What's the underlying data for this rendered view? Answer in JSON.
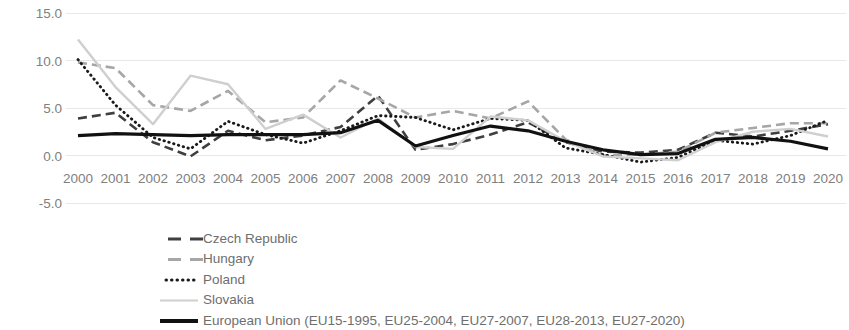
{
  "chart_data": {
    "type": "line",
    "title": "",
    "subtitle": "",
    "xlabel": "",
    "ylabel": "",
    "categories": [
      "2000",
      "2001",
      "2002",
      "2003",
      "2004",
      "2005",
      "2006",
      "2007",
      "2008",
      "2009",
      "2010",
      "2011",
      "2012",
      "2013",
      "2014",
      "2015",
      "2016",
      "2017",
      "2018",
      "2019",
      "2020"
    ],
    "x": [
      2000,
      2001,
      2002,
      2003,
      2004,
      2005,
      2006,
      2007,
      2008,
      2009,
      2010,
      2011,
      2012,
      2013,
      2014,
      2015,
      2016,
      2017,
      2018,
      2019,
      2020
    ],
    "ylim": [
      -5.0,
      15.0
    ],
    "yticks": [
      15.0,
      10.0,
      5.0,
      0.0,
      -5.0
    ],
    "ytick_labels": [
      "15.0",
      "10.0",
      "5.0",
      "0.0",
      "-5.0"
    ],
    "grid": true,
    "grid_axis": "y",
    "legend_position": "bottom-left",
    "series": [
      {
        "name": "Czech Republic",
        "style": "dashed",
        "color": "#3f3f3f",
        "width": 2.6,
        "dash": "9,5",
        "values": [
          3.9,
          4.5,
          1.4,
          -0.1,
          2.6,
          1.6,
          2.1,
          3.0,
          6.3,
          0.6,
          1.2,
          2.2,
          3.5,
          1.4,
          0.4,
          0.3,
          0.6,
          2.4,
          2.0,
          2.6,
          3.3
        ]
      },
      {
        "name": "Hungary",
        "style": "dashed",
        "color": "#a6a6a6",
        "width": 2.6,
        "dash": "9,5",
        "values": [
          9.8,
          9.2,
          5.3,
          4.7,
          6.8,
          3.5,
          4.0,
          7.9,
          6.0,
          4.0,
          4.7,
          3.9,
          5.7,
          1.7,
          0.0,
          0.1,
          0.4,
          2.4,
          2.9,
          3.4,
          3.4
        ]
      },
      {
        "name": "Poland",
        "style": "dotted",
        "color": "#1a1a1a",
        "width": 2.8,
        "dash": "0.5,4.5",
        "values": [
          10.1,
          5.3,
          1.9,
          0.7,
          3.6,
          2.2,
          1.3,
          2.6,
          4.2,
          4.0,
          2.7,
          3.9,
          3.7,
          0.8,
          0.1,
          -0.7,
          -0.2,
          1.6,
          1.2,
          2.1,
          3.7
        ]
      },
      {
        "name": "Slovakia",
        "style": "solid",
        "color": "#cfcfcf",
        "width": 2.4,
        "dash": "none",
        "values": [
          12.2,
          7.2,
          3.3,
          8.4,
          7.5,
          2.8,
          4.3,
          1.9,
          3.9,
          0.9,
          0.7,
          4.1,
          3.7,
          1.5,
          -0.1,
          -0.3,
          -0.5,
          1.4,
          2.5,
          2.8,
          2.0
        ]
      },
      {
        "name": "European Union (EU15-1995, EU25-2004, EU27-2007, EU28-2013, EU27-2020)",
        "style": "solid",
        "color": "#111111",
        "width": 3.2,
        "dash": "none",
        "values": [
          2.1,
          2.3,
          2.2,
          2.1,
          2.2,
          2.2,
          2.2,
          2.4,
          3.7,
          1.0,
          2.1,
          3.1,
          2.6,
          1.5,
          0.6,
          0.1,
          0.2,
          1.7,
          1.9,
          1.5,
          0.7
        ]
      }
    ]
  },
  "legend": {
    "items": [
      {
        "label": "Czech Republic"
      },
      {
        "label": "Hungary"
      },
      {
        "label": "Poland"
      },
      {
        "label": "Slovakia"
      },
      {
        "label": "European Union (EU15-1995, EU25-2004, EU27-2007, EU28-2013, EU27-2020)"
      }
    ]
  },
  "colors": {
    "czech": "#3f3f3f",
    "hungary": "#a6a6a6",
    "poland": "#1a1a1a",
    "slovakia": "#cfcfcf",
    "eu": "#111111",
    "grid": "#e8e8e8",
    "tick_text": "#808080",
    "legend_text": "#6e6e6e",
    "background": "#ffffff"
  }
}
